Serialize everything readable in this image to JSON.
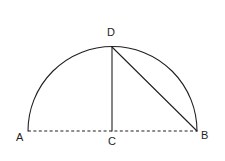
{
  "figure": {
    "background_color": "#ffffff",
    "stroke_color": "#231f20",
    "labels": {
      "a": "A",
      "b": "B",
      "c": "C",
      "d": "D"
    },
    "points": {
      "A": {
        "x": 28,
        "y": 131
      },
      "B": {
        "x": 197,
        "y": 131
      },
      "C": {
        "x": 112,
        "y": 131
      },
      "D": {
        "x": 112,
        "y": 47
      }
    },
    "elements": [
      {
        "name": "arc-a-d-b",
        "type": "arc",
        "style": "solid"
      },
      {
        "name": "segment-d-c",
        "type": "line",
        "style": "solid"
      },
      {
        "name": "segment-d-b",
        "type": "line",
        "style": "solid"
      },
      {
        "name": "segment-a-b",
        "type": "line",
        "style": "dashed"
      }
    ]
  }
}
